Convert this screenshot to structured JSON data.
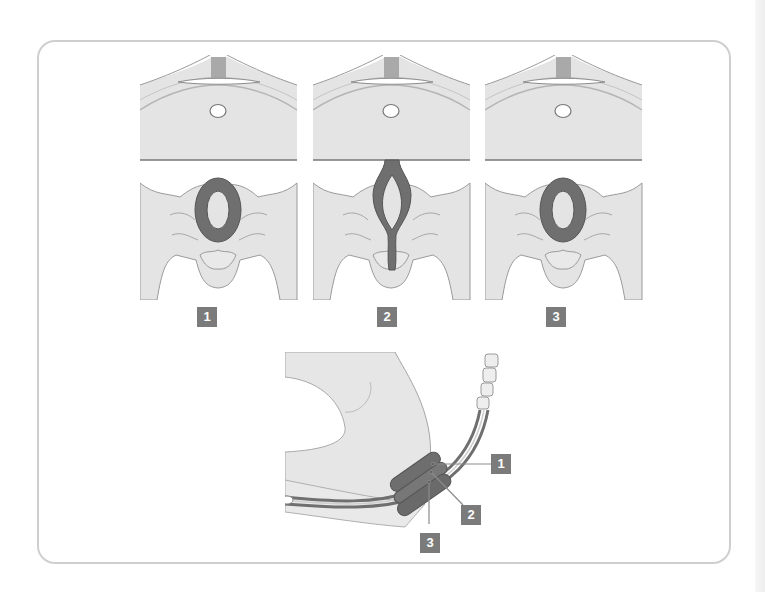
{
  "figure": {
    "colors": {
      "tissue": "#e4e4e4",
      "outline": "#9a9a9a",
      "muscle": "#6f6f6f",
      "muscle_dark": "#555555",
      "badge_bg": "#7b7b7b",
      "badge_text": "#ffffff",
      "frame": "#cfcfcf"
    },
    "panels": [
      {
        "id": "panel-1",
        "state": "contracted-ring",
        "label": "1"
      },
      {
        "id": "panel-2",
        "state": "stretched-open",
        "label": "2"
      },
      {
        "id": "panel-3",
        "state": "contracted-ring",
        "label": "3"
      }
    ],
    "section_labels": [
      "1",
      "2",
      "3"
    ]
  }
}
